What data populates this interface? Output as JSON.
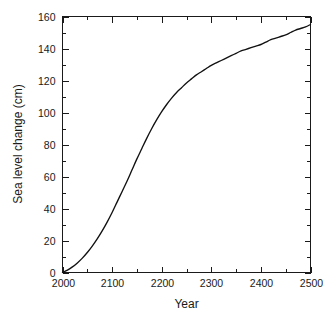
{
  "chart_data": {
    "type": "line",
    "title": "",
    "subtitle": "",
    "xlabel": "Year",
    "ylabel": "Sea level change (cm)",
    "xlim": [
      2000,
      2500
    ],
    "ylim": [
      0,
      160
    ],
    "grid": false,
    "legend": false,
    "legend_position": "none",
    "x_major_ticks": [
      2000,
      2100,
      2200,
      2300,
      2400,
      2500
    ],
    "x_minor_tick_interval": 50,
    "y_major_ticks": [
      0,
      20,
      40,
      60,
      80,
      100,
      120,
      140,
      160
    ],
    "y_minor_tick_interval": 10,
    "x_tick_labels": [
      "2000",
      "2100",
      "2200",
      "2300",
      "2400",
      "2500"
    ],
    "y_tick_labels": [
      "0",
      "20",
      "40",
      "60",
      "80",
      "100",
      "120",
      "140",
      "160"
    ],
    "series": [
      {
        "name": "Sea level change",
        "color": "#111111",
        "x": [
          2000,
          2010,
          2020,
          2030,
          2040,
          2050,
          2060,
          2070,
          2080,
          2090,
          2100,
          2110,
          2120,
          2130,
          2140,
          2150,
          2160,
          2170,
          2180,
          2190,
          2200,
          2210,
          2220,
          2230,
          2240,
          2250,
          2260,
          2270,
          2280,
          2290,
          2300,
          2310,
          2320,
          2330,
          2340,
          2350,
          2360,
          2370,
          2380,
          2390,
          2400,
          2410,
          2420,
          2430,
          2440,
          2450,
          2460,
          2470,
          2480,
          2490,
          2500
        ],
        "values": [
          0,
          1.5,
          3.5,
          6,
          9,
          12.5,
          16.5,
          21,
          26,
          31.5,
          37.5,
          44,
          50.5,
          57,
          64,
          71,
          77.5,
          84,
          90,
          95.5,
          100.5,
          105,
          109,
          112.5,
          115.5,
          118.5,
          121,
          123.5,
          125.5,
          127.5,
          129.5,
          131,
          132.5,
          134,
          135.5,
          137,
          138.5,
          139.5,
          140.5,
          141.5,
          142.5,
          144,
          145.5,
          146.5,
          147.5,
          148.5,
          150,
          151.5,
          152.5,
          153.5,
          155
        ]
      }
    ],
    "annotations": []
  }
}
